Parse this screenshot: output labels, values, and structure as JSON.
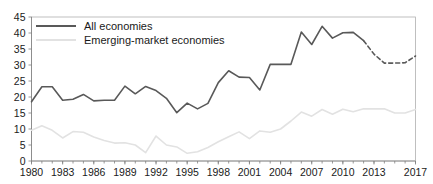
{
  "chart_data": {
    "type": "line",
    "title": "",
    "subtitle": "",
    "xlabel": "",
    "ylabel": "",
    "ylim": [
      0,
      45
    ],
    "xlim": [
      1980,
      2017
    ],
    "ytick_labels": [
      "45",
      "40",
      "35",
      "30",
      "25",
      "20",
      "15",
      "10",
      "5",
      "0"
    ],
    "ytick_values": [
      45,
      40,
      35,
      30,
      25,
      20,
      15,
      10,
      5,
      0
    ],
    "xtick_labels": [
      "1980",
      "1983",
      "1986",
      "1989",
      "1992",
      "1995",
      "1998",
      "2001",
      "2004",
      "2007",
      "2010",
      "2013",
      "2017"
    ],
    "xtick_values": [
      1980,
      1983,
      1986,
      1989,
      1992,
      1995,
      1998,
      2001,
      2004,
      2007,
      2010,
      2013,
      2017
    ],
    "grid": false,
    "legend_position": "top-left",
    "x": [
      1980,
      1981,
      1982,
      1983,
      1984,
      1985,
      1986,
      1987,
      1988,
      1989,
      1990,
      1991,
      1992,
      1993,
      1994,
      1995,
      1996,
      1997,
      1998,
      1999,
      2000,
      2001,
      2002,
      2003,
      2004,
      2005,
      2006,
      2007,
      2008,
      2009,
      2010,
      2011,
      2012,
      2013,
      2014,
      2015,
      2016,
      2017
    ],
    "series": [
      {
        "name": "All economies",
        "color": "#595959",
        "width": 1.6,
        "style": "solid",
        "forecast_from": 2012,
        "forecast_style": "dashed",
        "values": [
          18.5,
          23.2,
          23.2,
          19.0,
          19.3,
          20.8,
          18.8,
          19.0,
          19.0,
          23.4,
          21.0,
          23.3,
          22.0,
          19.6,
          15.1,
          18.1,
          16.3,
          18.0,
          24.5,
          28.2,
          26.2,
          26.1,
          22.2,
          30.2,
          30.2,
          30.2,
          40.3,
          36.4,
          42.1,
          38.4,
          40.1,
          40.2,
          37.6,
          33.4,
          30.6,
          30.6,
          30.7,
          32.8
        ]
      },
      {
        "name": "Emerging-market economies",
        "color": "#e2e2e2",
        "width": 1.6,
        "style": "solid",
        "values": [
          9.6,
          11.0,
          9.6,
          7.2,
          9.2,
          9.0,
          7.5,
          6.4,
          5.6,
          5.7,
          5.0,
          2.6,
          7.8,
          5.0,
          4.4,
          2.4,
          2.9,
          4.2,
          6.0,
          7.6,
          9.1,
          7.0,
          9.4,
          9.0,
          10.0,
          12.5,
          15.3,
          14.0,
          16.1,
          14.6,
          16.2,
          15.4,
          16.3,
          16.3,
          16.3,
          15.0,
          15.0,
          16.1
        ]
      }
    ]
  },
  "legend": {
    "items": [
      {
        "label": "All economies",
        "color": "#595959"
      },
      {
        "label": "Emerging-market economies",
        "color": "#e2e2e2"
      }
    ]
  }
}
